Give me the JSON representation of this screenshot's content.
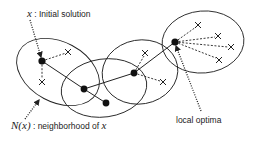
{
  "labels": {
    "initial_symbol": "x",
    "initial_sep": " : ",
    "initial_text": "Initial solution",
    "neighborhood_symbol": "N(x)",
    "neighborhood_sep": " : ",
    "neighborhood_text": "neighborhood of ",
    "neighborhood_var": "x",
    "local_optima": "local optima"
  },
  "elements": {
    "solutions": [
      {
        "id": "s1",
        "x": 42,
        "y": 61
      },
      {
        "id": "s2",
        "x": 84,
        "y": 89
      },
      {
        "id": "s3",
        "x": 134,
        "y": 73
      },
      {
        "id": "s4",
        "x": 175,
        "y": 42
      },
      {
        "id": "s_side",
        "x": 106,
        "y": 103
      }
    ],
    "neighbors": [
      {
        "x": 68,
        "y": 52,
        "of": "s1"
      },
      {
        "x": 42,
        "y": 82,
        "of": "s1"
      },
      {
        "x": 145,
        "y": 53,
        "of": "s3"
      },
      {
        "x": 163,
        "y": 82,
        "of": "s3"
      },
      {
        "x": 198,
        "y": 25,
        "of": "s4"
      },
      {
        "x": 218,
        "y": 36,
        "of": "s4"
      },
      {
        "x": 231,
        "y": 47,
        "of": "s4"
      },
      {
        "x": 219,
        "y": 60,
        "of": "s4"
      }
    ],
    "colors": {
      "stroke": "#222222",
      "background": "#ffffff"
    }
  }
}
